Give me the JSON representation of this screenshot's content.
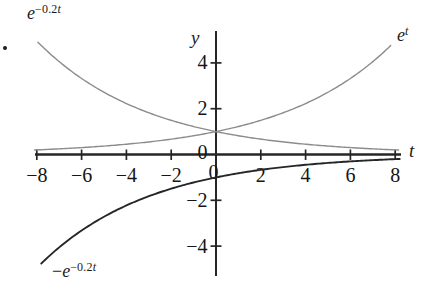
{
  "chart_data": {
    "type": "line",
    "title": "",
    "xlabel": "t",
    "ylabel": "y",
    "xlim": [
      -8.2,
      8.3
    ],
    "ylim": [
      -5.3,
      5.3
    ],
    "grid": false,
    "axis_color": "#262626",
    "x_ticks": [
      -8,
      -6,
      -4,
      -2,
      2,
      4,
      6,
      8
    ],
    "y_ticks": [
      -4,
      -2,
      2,
      4
    ],
    "x_tick_labels": [
      {
        "value": -8,
        "text": "−8"
      },
      {
        "value": -6,
        "text": "−6"
      },
      {
        "value": -4,
        "text": "−4"
      },
      {
        "value": -2,
        "text": "−2"
      },
      {
        "value": 0,
        "text": "0"
      },
      {
        "value": 2,
        "text": "2"
      },
      {
        "value": 4,
        "text": "4"
      },
      {
        "value": 6,
        "text": "6"
      },
      {
        "value": 8,
        "text": "8"
      }
    ],
    "y_tick_labels": [
      {
        "value": 4,
        "text": "4"
      },
      {
        "value": 2,
        "text": "2"
      },
      {
        "value": 0,
        "text": "0"
      },
      {
        "value": -2,
        "text": "−2"
      },
      {
        "value": -4,
        "text": "−4"
      }
    ],
    "series": [
      {
        "id": "exp-neg-02t",
        "label": "e^(−0.2t)",
        "label_pre": "",
        "label_base": "e",
        "label_sup_num": "−0.2",
        "label_sup_var": "t",
        "color": "#8c8c8c",
        "stroke_width": 1.4,
        "coef": 1,
        "rate": -0.2,
        "t_start": -7.95,
        "t_end": 8.2
      },
      {
        "id": "exp-t",
        "label": "e^t",
        "label_pre": "",
        "label_base": "e",
        "label_sup_num": "",
        "label_sup_var": "t",
        "color": "#8c8c8c",
        "stroke_width": 1.4,
        "coef": 1,
        "rate": 0.2,
        "t_start": -8.1,
        "t_end": 7.85
      },
      {
        "id": "neg-exp-neg-02t",
        "label": "−e^(−0.2t)",
        "label_pre": "−",
        "label_base": "e",
        "label_sup_num": "−0.2",
        "label_sup_var": "t",
        "color": "#262626",
        "stroke_width": 1.9,
        "coef": -1,
        "rate": -0.2,
        "t_start": -7.8,
        "t_end": 8.2
      }
    ],
    "points_sample": {
      "t": [
        -8,
        -6,
        -4,
        -2,
        0,
        2,
        4,
        6,
        8
      ],
      "e_neg02t": [
        4.95,
        3.32,
        2.23,
        1.49,
        1,
        0.67,
        0.45,
        0.3,
        0.2
      ],
      "e_t_as_drawn": [
        0.2,
        0.3,
        0.45,
        0.67,
        1,
        1.49,
        2.23,
        3.32,
        4.95
      ],
      "neg_e_neg02t": [
        -4.95,
        -3.32,
        -2.23,
        -1.49,
        -1,
        -0.67,
        -0.45,
        -0.3,
        -0.2
      ]
    }
  }
}
